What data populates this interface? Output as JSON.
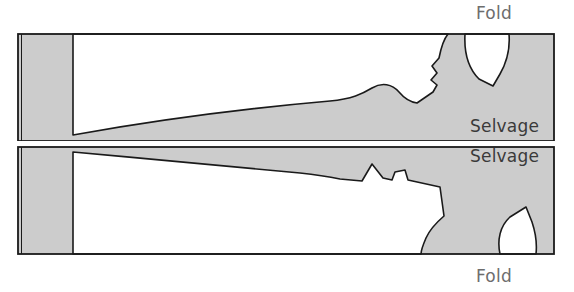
{
  "diagram": {
    "type": "cutting-layout",
    "labels": {
      "fold_top": "Fold",
      "fold_bottom": "Fold",
      "selvage_top": "Selvage",
      "selvage_bottom": "Selvage"
    },
    "colors": {
      "fabric_fill": "#cccccc",
      "piece_fill": "#ffffff",
      "outline": "#1a1a1a",
      "label_text": "#6d6d6d",
      "selvage_text": "#3a3a3a",
      "background": "#ffffff"
    },
    "geometry": {
      "fabric_rect": {
        "x": 17,
        "y": 33,
        "width": 538,
        "height": 222
      },
      "center_selvage_y": 143,
      "center_gap": 4,
      "top_half": {
        "y": 33,
        "height": 108
      },
      "bottom_half": {
        "y": 147,
        "height": 108
      }
    },
    "regions": [
      {
        "name": "left-fabric-strip-top",
        "fill": "fabric"
      },
      {
        "name": "left-fabric-strip-bottom",
        "fill": "fabric"
      },
      {
        "name": "upper-pattern-piece",
        "fill": "piece"
      },
      {
        "name": "lower-pattern-piece",
        "fill": "piece"
      },
      {
        "name": "upper-sleeve-notch",
        "fill": "piece"
      },
      {
        "name": "lower-sleeve-notch",
        "fill": "piece"
      }
    ]
  }
}
